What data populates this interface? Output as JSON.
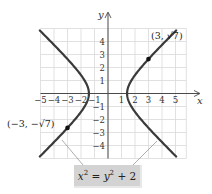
{
  "chart_data": {
    "type": "line",
    "title": "",
    "equation": "x^2 = y^2 + 2",
    "xlabel": "x",
    "ylabel": "y",
    "xlim": [
      -5,
      5.8
    ],
    "ylim": [
      -5,
      5
    ],
    "grid": true,
    "x_ticks": [
      -5,
      -4,
      -3,
      -2,
      -1,
      1,
      2,
      3,
      4,
      5
    ],
    "y_ticks": [
      -4,
      -3,
      -2,
      -1,
      1,
      2,
      3,
      4
    ],
    "series": [
      {
        "name": "right branch",
        "relation": "x = sqrt(y^2 + 2)",
        "vertex": [
          1.414,
          0
        ]
      },
      {
        "name": "left branch",
        "relation": "x = -sqrt(y^2 + 2)",
        "vertex": [
          -1.414,
          0
        ]
      }
    ],
    "points": [
      {
        "x": 3,
        "y": 2.646,
        "label": "(3, √7)"
      },
      {
        "x": -3,
        "y": -2.646,
        "label": "(−3, −√7)"
      }
    ],
    "annotations": [
      {
        "text": "x² = y² + 2",
        "type": "callout",
        "points_to": [
          "left branch",
          "right branch"
        ]
      }
    ]
  },
  "labels": {
    "x_axis": "x",
    "y_axis": "y",
    "point_right": "(3, √7)",
    "point_left": "(−3, −√7)",
    "equation": {
      "lhs_var": "x",
      "lhs_exp": "2",
      "eq": " = ",
      "rhs_var": "y",
      "rhs_exp": "2",
      "rhs_rest": " + 2"
    }
  },
  "colors": {
    "curve": "#3a3a3a",
    "grid": "#d9d9d9",
    "axis": "#4a4a4a",
    "callout_box": "#d3d3d3"
  }
}
